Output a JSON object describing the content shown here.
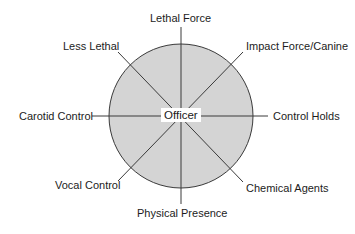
{
  "diagram": {
    "type": "radial force options wheel",
    "center_label": "Officer",
    "fill_color": "#d4d4d4",
    "line_color": "#3a3a3a",
    "spokes": [
      {
        "id": "lethal-force",
        "label": "Lethal Force",
        "position": "top"
      },
      {
        "id": "impact-force-canine",
        "label": "Impact Force/Canine",
        "position": "top-right"
      },
      {
        "id": "control-holds",
        "label": "Control Holds",
        "position": "right"
      },
      {
        "id": "chemical-agents",
        "label": "Chemical Agents",
        "position": "bottom-right"
      },
      {
        "id": "physical-presence",
        "label": "Physical Presence",
        "position": "bottom"
      },
      {
        "id": "vocal-control",
        "label": "Vocal Control",
        "position": "bottom-left"
      },
      {
        "id": "carotid-control",
        "label": "Carotid Control",
        "position": "left"
      },
      {
        "id": "less-lethal",
        "label": "Less Lethal",
        "position": "top-left"
      }
    ]
  }
}
